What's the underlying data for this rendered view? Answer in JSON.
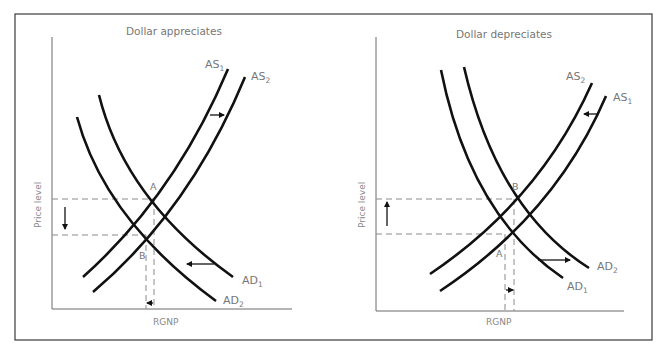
{
  "figure": {
    "panels": [
      {
        "id": "left",
        "title": "Dollar appreciates",
        "y_axis_label": "Price level",
        "x_axis_label": "RGNP",
        "curves": [
          {
            "name": "AS",
            "subscript": "1",
            "type": "supply"
          },
          {
            "name": "AS",
            "subscript": "2",
            "type": "supply"
          },
          {
            "name": "AD",
            "subscript": "1",
            "type": "demand"
          },
          {
            "name": "AD",
            "subscript": "2",
            "type": "demand"
          }
        ],
        "points": [
          {
            "label": "A",
            "description": "initial equilibrium (AS1, AD1)"
          },
          {
            "label": "B",
            "description": "new equilibrium (AS2, AD2)"
          }
        ],
        "shifts": {
          "supply": "right",
          "demand": "left",
          "price_level": "down",
          "rgnp": "left"
        }
      },
      {
        "id": "right",
        "title": "Dollar depreciates",
        "y_axis_label": "Price level",
        "x_axis_label": "RGNP",
        "curves": [
          {
            "name": "AS",
            "subscript": "2",
            "type": "supply"
          },
          {
            "name": "AS",
            "subscript": "1",
            "type": "supply"
          },
          {
            "name": "AD",
            "subscript": "2",
            "type": "demand"
          },
          {
            "name": "AD",
            "subscript": "1",
            "type": "demand"
          }
        ],
        "points": [
          {
            "label": "B",
            "description": "new equilibrium (AS2, AD2)"
          },
          {
            "label": "A",
            "description": "initial equilibrium (AS1, AD1)"
          }
        ],
        "shifts": {
          "supply": "left",
          "demand": "right",
          "price_level": "up",
          "rgnp": "right"
        }
      }
    ]
  },
  "colors": {
    "curve": "#111111",
    "text": "#777777",
    "axis": "#6a6a6a",
    "dashed_guides": "#8a8a8a",
    "frame": "#3a3a3a"
  }
}
